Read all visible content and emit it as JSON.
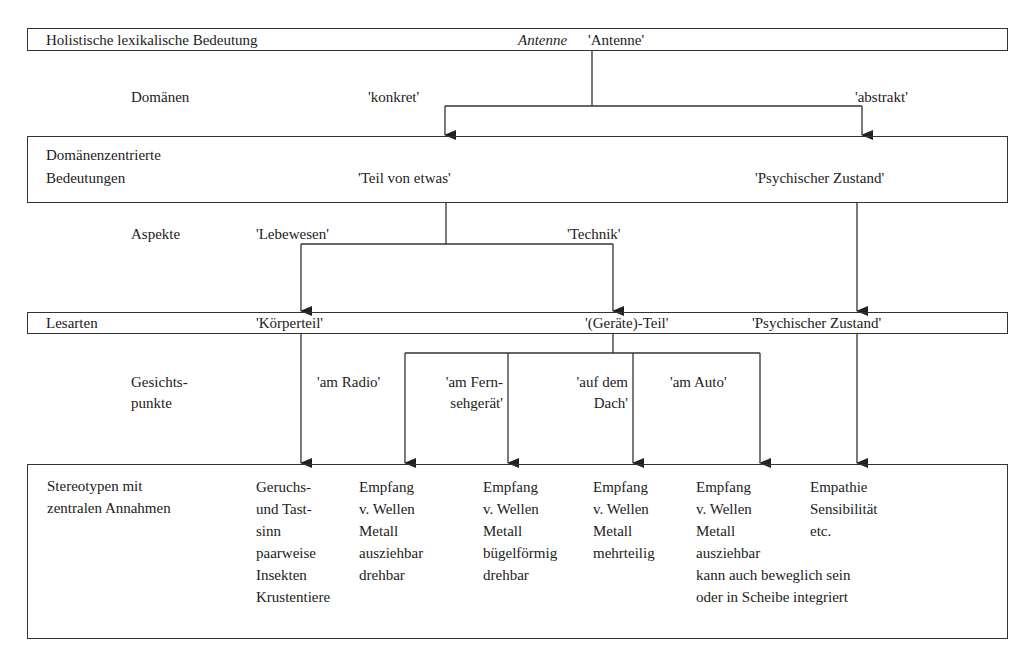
{
  "levels": {
    "holistic": {
      "label": "Holistische lexikalische Bedeutung",
      "word": "Antenne",
      "gloss": "'Antenne'"
    },
    "domains_label": "Domänen",
    "domains": [
      "'konkret'",
      "'abstrakt'"
    ],
    "domain_centered": {
      "label_line1": "Domänenzentrierte",
      "label_line2": "Bedeutungen",
      "items": [
        "'Teil von etwas'",
        "'Psychischer Zustand'"
      ]
    },
    "aspects_label": "Aspekte",
    "aspects": [
      "'Lebewesen'",
      "'Technik'"
    ],
    "readings": {
      "label": "Lesarten",
      "items": [
        "'Körperteil'",
        "'(Geräte)-Teil'",
        "'Psychischer Zustand'"
      ]
    },
    "viewpoints_label_line1": "Gesichts-",
    "viewpoints_label_line2": "punkte",
    "viewpoints": [
      {
        "line1": "'am Radio'",
        "line2": ""
      },
      {
        "line1": "'am Fern-",
        "line2": "sehgerät'"
      },
      {
        "line1": "'auf dem",
        "line2": "Dach'"
      },
      {
        "line1": "'am Auto'",
        "line2": ""
      }
    ],
    "stereotypes": {
      "label_line1": "Stereotypen mit",
      "label_line2": "zentralen Annahmen",
      "columns": [
        "Geruchs-\nund Tast-\nsinn\npaarweise\nInsekten\nKrustentiere",
        "Empfang\nv. Wellen\nMetall\nausziehbar\ndrehbar",
        "Empfang\nv. Wellen\nMetall\nbügelförmig\ndrehbar",
        "Empfang\nv. Wellen\nMetall\nmehrteilig",
        "Empfang\nv. Wellen\nMetall\nausziehbar\nkann auch beweglich sein\noder in Scheibe integriert",
        "Empathie\nSensibilität\netc."
      ]
    }
  }
}
